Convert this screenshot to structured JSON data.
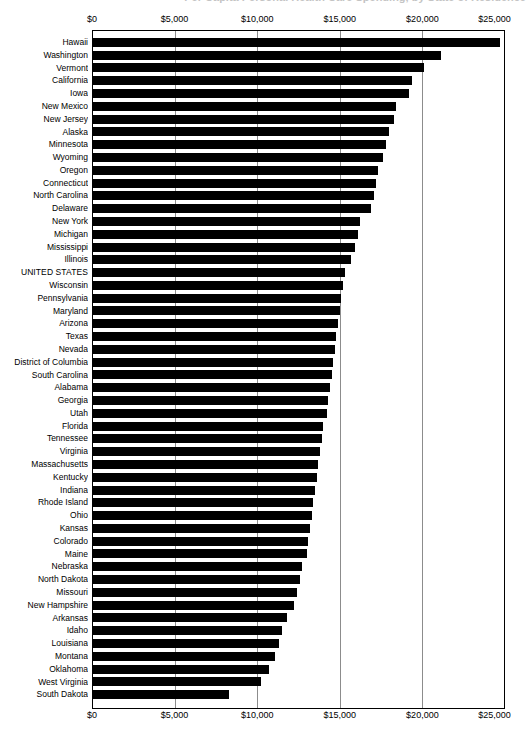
{
  "chart": {
    "title": "Per Capita Personal Health Care Spending, by State of Residence",
    "axis_top_label": "",
    "axis_bottom_label": ""
  },
  "chart_data": {
    "type": "bar",
    "orientation": "horizontal",
    "title": "Per Capita Personal Health Care Spending, by State of Residence",
    "xlabel": "",
    "ylabel": "",
    "xlim": [
      0,
      25000
    ],
    "grid": true,
    "legend": "none",
    "tick_labels": [
      "$0",
      "$5,000",
      "$10,000",
      "$15,000",
      "$20,000",
      "$25,000"
    ],
    "tick_values": [
      0,
      5000,
      10000,
      15000,
      20000,
      25000
    ],
    "bar_color": "#000000",
    "categories": [
      "Hawaii",
      "Washington",
      "Vermont",
      "California",
      "Iowa",
      "New Mexico",
      "New Jersey",
      "Alaska",
      "Minnesota",
      "Wyoming",
      "Oregon",
      "Connecticut",
      "North Carolina",
      "Delaware",
      "New York",
      "Michigan",
      "Mississippi",
      "Illinois",
      "UNITED STATES",
      "Wisconsin",
      "Pennsylvania",
      "Maryland",
      "Arizona",
      "Texas",
      "Nevada",
      "District of Columbia",
      "South Carolina",
      "Alabama",
      "Georgia",
      "Utah",
      "Florida",
      "Tennessee",
      "Virginia",
      "Massachusetts",
      "Kentucky",
      "Indiana",
      "Rhode Island",
      "Ohio",
      "Kansas",
      "Colorado",
      "Maine",
      "Nebraska",
      "North Dakota",
      "Missouri",
      "New Hampshire",
      "Arkansas",
      "Idaho",
      "Louisiana",
      "Montana",
      "Oklahoma",
      "West Virginia",
      "South Dakota"
    ],
    "values": [
      24700,
      21100,
      20100,
      19400,
      19200,
      18400,
      18300,
      18000,
      17800,
      17600,
      17300,
      17200,
      17100,
      16900,
      16200,
      16100,
      15900,
      15700,
      15300,
      15200,
      15100,
      15000,
      14900,
      14800,
      14700,
      14600,
      14500,
      14400,
      14300,
      14200,
      14000,
      13900,
      13800,
      13700,
      13600,
      13500,
      13400,
      13300,
      13200,
      13100,
      13000,
      12700,
      12600,
      12400,
      12200,
      11800,
      11500,
      11300,
      11100,
      10700,
      10200,
      8300
    ]
  }
}
